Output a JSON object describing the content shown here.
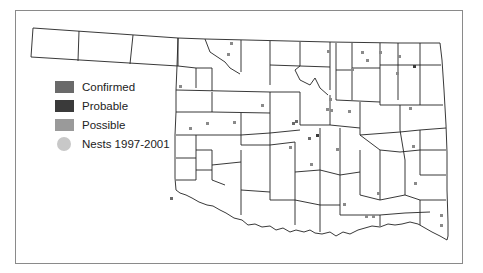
{
  "map": {
    "title": "Oklahoma county atlas map",
    "legend": {
      "items": [
        {
          "label": "Confirmed",
          "color": "#6a6a6a",
          "shape": "square"
        },
        {
          "label": "Probable",
          "color": "#3a3a3a",
          "shape": "square"
        },
        {
          "label": "Possible",
          "color": "#9a9a9a",
          "shape": "square"
        },
        {
          "label": "Nests 1997-2001",
          "color": "#c8c8c8",
          "shape": "circle"
        }
      ]
    },
    "colors": {
      "border": "#222222",
      "frame": "#8a8a8a",
      "background": "#ffffff"
    }
  }
}
